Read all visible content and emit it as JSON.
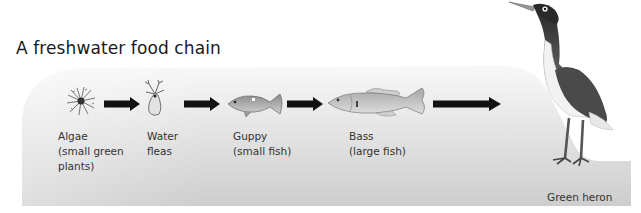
{
  "title": "A freshwater food chain",
  "chain": [
    {
      "name": "algae",
      "label_line1": "Algae",
      "label_line2": "(small green",
      "label_line3": "plants)"
    },
    {
      "name": "water-fleas",
      "label_line1": "Water",
      "label_line2": "fleas"
    },
    {
      "name": "guppy",
      "label_line1": "Guppy",
      "label_line2": "(small fish)"
    },
    {
      "name": "bass",
      "label_line1": "Bass",
      "label_line2": "(large fish)"
    },
    {
      "name": "green-heron",
      "label_line1": "Green heron"
    }
  ],
  "colors": {
    "water_top": "#f7f7f7",
    "water_bottom": "#cfcfcf",
    "arrow": "#111111",
    "heron_dark": "#333333",
    "heron_wing": "#555555"
  }
}
